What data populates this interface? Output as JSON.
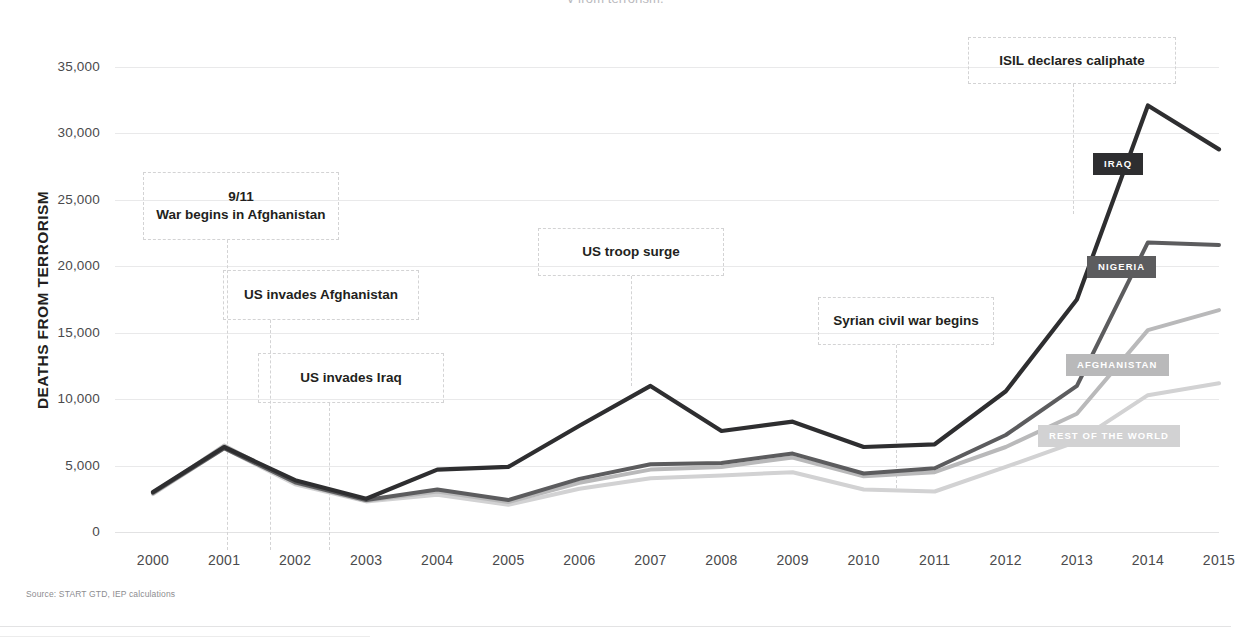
{
  "page": {
    "clipped_header_text": "y from terrorism.",
    "source_note": "Source: START GTD, IEP calculations"
  },
  "chart_data": {
    "type": "line",
    "title": "",
    "xlabel": "",
    "ylabel": "DEATHS FROM TERRORISM",
    "x": [
      2000,
      2001,
      2002,
      2003,
      2004,
      2005,
      2006,
      2007,
      2008,
      2009,
      2010,
      2011,
      2012,
      2013,
      2014,
      2015
    ],
    "xtick_labels": [
      "2000",
      "2001",
      "2002",
      "2003",
      "2004",
      "2005",
      "2006",
      "2007",
      "2008",
      "2009",
      "2010",
      "2011",
      "2012",
      "2013",
      "2014",
      "2015"
    ],
    "ylim": [
      0,
      35000
    ],
    "ytick_labels": [
      "0",
      "5,000",
      "10,000",
      "15,000",
      "20,000",
      "25,000",
      "30,000",
      "35,000"
    ],
    "ytick_values": [
      0,
      5000,
      10000,
      15000,
      20000,
      25000,
      30000,
      35000
    ],
    "grid": true,
    "legend": "inline-badges",
    "series": [
      {
        "name": "IRAQ",
        "color": "#2e2e30",
        "label_color": "#ffffff",
        "values": [
          3000,
          6400,
          3900,
          2500,
          4700,
          4900,
          8000,
          11000,
          7600,
          8300,
          6400,
          6600,
          10600,
          17500,
          32100,
          28800
        ]
      },
      {
        "name": "NIGERIA",
        "color": "#5c5c5e",
        "label_color": "#ffffff",
        "values": [
          2950,
          6300,
          3750,
          2400,
          3200,
          2400,
          4000,
          5100,
          5200,
          5900,
          4400,
          4800,
          7300,
          11000,
          21800,
          21600
        ]
      },
      {
        "name": "AFGHANISTAN",
        "color": "#b9b9ba",
        "label_color": "#ffffff",
        "values": [
          2900,
          6500,
          3700,
          2350,
          3050,
          2250,
          3700,
          4700,
          4900,
          5600,
          4200,
          4500,
          6400,
          8900,
          15200,
          16700
        ]
      },
      {
        "name": "REST OF THE WORLD",
        "color": "#d2d2d3",
        "label_color": "#ffffff",
        "values": [
          2850,
          6300,
          3600,
          2300,
          2800,
          2050,
          3250,
          4050,
          4250,
          4500,
          3200,
          3050,
          4900,
          6800,
          10300,
          11200
        ]
      }
    ],
    "annotations": [
      {
        "id": "sept11",
        "text": "9/11\nWar begins in Afghanistan",
        "x_year": 2001,
        "label_value": 24300
      },
      {
        "id": "us-invades-afghanistan",
        "text": "US invades Afghanistan",
        "x_year": 2002,
        "label_value": 19200
      },
      {
        "id": "us-invades-iraq",
        "text": "US invades Iraq",
        "x_year": 2003,
        "label_value": 12200
      },
      {
        "id": "us-troop-surge",
        "text": "US troop surge",
        "x_year": 2007,
        "label_value": 20700
      },
      {
        "id": "syrian-civil-war",
        "text": "Syrian civil war begins",
        "x_year": 2011,
        "label_value": 15500
      },
      {
        "id": "isil-caliphate",
        "text": "ISIL declares caliphate",
        "x_year": 2014,
        "label_value": 36200
      }
    ]
  },
  "annotation_labels": {
    "sept11_line1": "9/11",
    "sept11_line2": "War begins in Afghanistan",
    "us_invades_afghanistan": "US invades Afghanistan",
    "us_invades_iraq": "US invades Iraq",
    "us_troop_surge": "US troop surge",
    "syrian_civil_war": "Syrian civil war begins",
    "isil_caliphate": "ISIL declares caliphate"
  },
  "series_labels": {
    "iraq": "IRAQ",
    "nigeria": "NIGERIA",
    "afghanistan": "AFGHANISTAN",
    "rest_of_world": "REST OF THE WORLD"
  }
}
